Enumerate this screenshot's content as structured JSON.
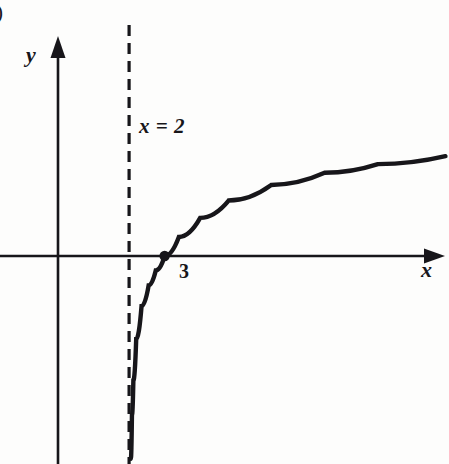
{
  "figure": {
    "tag": ")",
    "background_color": "#fdfdfc",
    "ink_color": "#17161a"
  },
  "labels": {
    "y_axis": "y",
    "x_axis": "x",
    "asymptote": "x = 2",
    "intercept": "3"
  },
  "chart_data": {
    "type": "line",
    "title": "",
    "subtitle": "",
    "xlabel": "x",
    "ylabel": "y",
    "grid": false,
    "legend": null,
    "function": "y = log(x - 2)",
    "xlim": [
      0,
      11
    ],
    "ylim": [
      -6,
      3
    ],
    "asymptotes": [
      {
        "type": "vertical",
        "x": 2,
        "style": "dashed",
        "label": "x = 2"
      }
    ],
    "intercepts": [
      {
        "kind": "x-intercept",
        "x": 3,
        "y": 0,
        "label": "3",
        "marked": true
      }
    ],
    "points": [
      {
        "x": 2.05,
        "y": -5.85
      },
      {
        "x": 2.08,
        "y": -4.6
      },
      {
        "x": 2.12,
        "y": -3.6
      },
      {
        "x": 2.2,
        "y": -2.4
      },
      {
        "x": 2.35,
        "y": -1.45
      },
      {
        "x": 2.55,
        "y": -0.85
      },
      {
        "x": 2.75,
        "y": -0.42
      },
      {
        "x": 3.0,
        "y": 0.0
      },
      {
        "x": 3.4,
        "y": 0.55
      },
      {
        "x": 4.0,
        "y": 1.1
      },
      {
        "x": 4.8,
        "y": 1.6
      },
      {
        "x": 6.0,
        "y": 2.05
      },
      {
        "x": 7.5,
        "y": 2.4
      },
      {
        "x": 9.0,
        "y": 2.65
      },
      {
        "x": 10.9,
        "y": 2.88
      }
    ],
    "axes": {
      "x_axis": {
        "drawn": true,
        "arrow_end": "right",
        "y_value": 0
      },
      "y_axis": {
        "drawn": true,
        "arrow_end": "up",
        "x_value": 0
      }
    }
  }
}
